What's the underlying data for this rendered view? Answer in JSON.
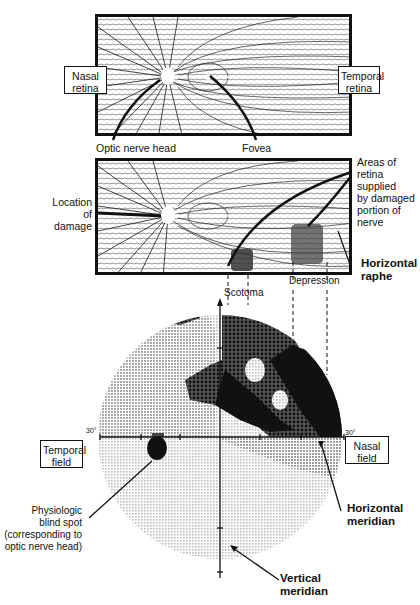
{
  "top_panel": {
    "left_box": "Nasal\nretina",
    "left_box_line1": "Nasal",
    "left_box_line2": "retina",
    "right_box_line1": "Temporal",
    "right_box_line2": "retina",
    "optic_nerve_label": "Optic nerve head",
    "fovea_label": "Fovea"
  },
  "middle_panel": {
    "damage_label_lines": [
      "Location",
      "of",
      "damage"
    ],
    "areas_label_lines": [
      "Areas of",
      "retina",
      "supplied",
      "by damaged",
      "portion of",
      "nerve"
    ],
    "raphe_label_lines": [
      "Horizontal",
      "raphe"
    ]
  },
  "visual_field": {
    "scotoma_label": "Scotoma",
    "depression_label": "Depression",
    "left_degree": "30°",
    "right_degree": "30°",
    "temporal_box_lines": [
      "Temporal",
      "field"
    ],
    "nasal_box_lines": [
      "Nasal",
      "field"
    ],
    "blind_spot_lines": [
      "Physiologic",
      "blind spot",
      "(corresponding to",
      "optic nerve head)"
    ],
    "horizontal_meridian_lines": [
      "Horizontal",
      "meridian"
    ],
    "vertical_meridian_lines": [
      "Vertical",
      "meridian"
    ]
  },
  "colors": {
    "ink": "#111111",
    "paper": "#ffffff",
    "light_gray_field": "#d8d8d8",
    "mid_gray_field": "#9a9a9a",
    "dark_defect": "#1a1a1a"
  }
}
